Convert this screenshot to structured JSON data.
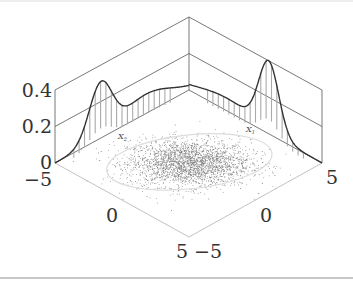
{
  "chart_data": {
    "type": "3d-scatter-with-marginal-densities",
    "title": "",
    "axes": {
      "x1": {
        "label": "X1",
        "range": [
          -5,
          5
        ],
        "ticks": [
          -5,
          0,
          5
        ]
      },
      "x2": {
        "label": "X2",
        "range": [
          -5,
          5
        ],
        "ticks": [
          -5,
          0,
          5
        ]
      },
      "z": {
        "label": "",
        "range": [
          0,
          0.4
        ],
        "ticks": [
          0,
          0.2,
          0.4
        ]
      }
    },
    "tick_labels": {
      "z": [
        "0",
        "0.2",
        "0.4"
      ],
      "left_axis": [
        "-5",
        "0",
        "5"
      ],
      "right_axis": [
        "-5",
        "0",
        "5"
      ]
    },
    "marginals": [
      {
        "name": "X2",
        "wall": "left-back",
        "components": [
          {
            "weight": 0.55,
            "mean": -1.6,
            "sd": 0.85
          },
          {
            "weight": 0.45,
            "mean": 1.8,
            "sd": 1.9
          }
        ],
        "peak_density": 0.31
      },
      {
        "name": "X1",
        "wall": "back-right",
        "components": [
          {
            "weight": 0.35,
            "mean": -2.2,
            "sd": 2.2
          },
          {
            "weight": 0.65,
            "mean": 1.0,
            "sd": 0.75
          }
        ],
        "peak_density": 0.4
      }
    ],
    "scatter": {
      "n_points": 2600,
      "mean": [
        0,
        0
      ],
      "sd": [
        1.6,
        1.1
      ],
      "color": "#222222"
    },
    "ellipse": {
      "center": [
        0,
        0
      ],
      "semi_axes": [
        3.6,
        2.4
      ],
      "color": "#dddddd"
    },
    "grid": false,
    "legend": null
  },
  "labels": {
    "z0": "0",
    "z02": "0.2",
    "z04": "0.4",
    "left_m5": "−5",
    "left_0": "0",
    "left_5": "5",
    "right_m5": "−5",
    "right_0": "0",
    "right_5": "5",
    "x1": "X",
    "x1_sub": "1",
    "x2": "X",
    "x2_sub": "2"
  },
  "colors": {
    "frame": "#555555",
    "floor_axis": "#bbbbbb",
    "curve": "#333333",
    "stems": "#aaaaaa",
    "points": "#222222",
    "ellipse": "#dcdcdc"
  }
}
